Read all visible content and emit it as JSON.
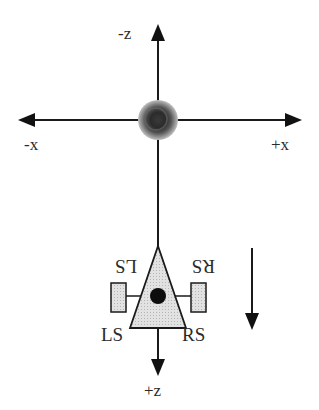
{
  "diagram": {
    "type": "robot-coordinate-frame",
    "axes": {
      "neg_z_label": "-z",
      "pos_z_label": "+z",
      "neg_x_label": "-x",
      "pos_x_label": "+x"
    },
    "origin": {
      "object": "sphere-target"
    },
    "robot": {
      "shape": "triangle",
      "fill_color": "#d8d8d8",
      "wheel_label_left": "LS",
      "wheel_label_right": "RS",
      "mirrored_label_left": "LS",
      "mirrored_label_right": "RS"
    },
    "motion_direction": "down",
    "colors": {
      "line": "#1a1a1a",
      "background": "#ffffff",
      "sphere_dark": "#2b2b2b",
      "sphere_light": "#9a9a9a"
    }
  }
}
